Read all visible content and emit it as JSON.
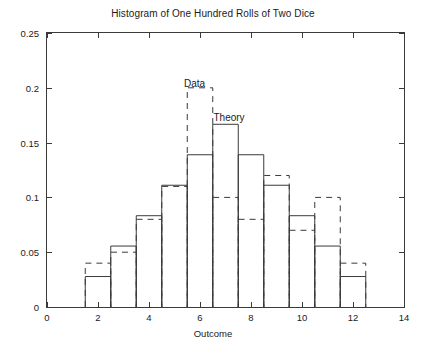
{
  "figure": {
    "title": "Histogram of One Hundred Rolls of Two Dice",
    "xlabel": "Outcome",
    "ylabel": "Relative Frequency"
  },
  "annotations": {
    "data_label": "Data",
    "theory_label": "Theory"
  },
  "axes": {
    "x_ticks": [
      "0",
      "2",
      "4",
      "6",
      "8",
      "10",
      "12",
      "14"
    ],
    "y_ticks": [
      "0",
      "0.05",
      "0.1",
      "0.15",
      "0.2",
      "0.25"
    ]
  },
  "chart_data": {
    "type": "bar",
    "title": "Histogram of One Hundred Rolls of Two Dice",
    "xlabel": "Outcome",
    "ylabel": "Relative Frequency",
    "xlim": [
      0,
      14
    ],
    "ylim": [
      0,
      0.25
    ],
    "x_ticks": [
      0,
      2,
      4,
      6,
      8,
      10,
      12,
      14
    ],
    "y_ticks": [
      0,
      0.05,
      0.1,
      0.15,
      0.2,
      0.25
    ],
    "grid": false,
    "legend": "inline-annotations",
    "categories": [
      2,
      3,
      4,
      5,
      6,
      7,
      8,
      9,
      10,
      11,
      12
    ],
    "series": [
      {
        "name": "Theory",
        "style": "solid-outline-bar",
        "values": [
          0.0278,
          0.0556,
          0.0833,
          0.1111,
          0.1389,
          0.1667,
          0.1389,
          0.1111,
          0.0833,
          0.0556,
          0.0278
        ]
      },
      {
        "name": "Data",
        "style": "dashed-outline-bar",
        "values": [
          0.04,
          0.05,
          0.08,
          0.11,
          0.2,
          0.1,
          0.08,
          0.12,
          0.07,
          0.1,
          0.04
        ]
      }
    ]
  }
}
